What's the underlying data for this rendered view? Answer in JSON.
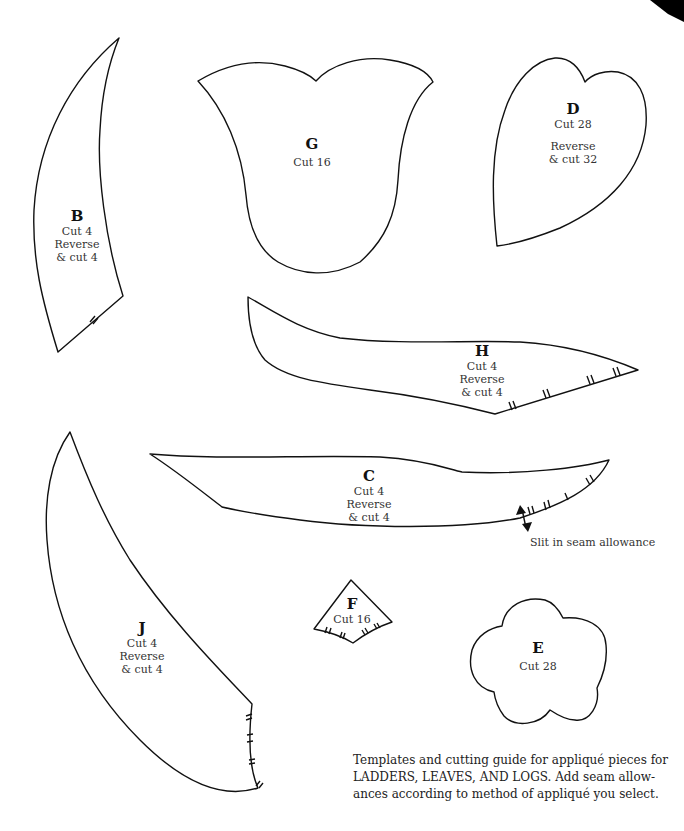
{
  "pieces": {
    "B": {
      "letter": "B",
      "lines": [
        "Cut 4",
        "Reverse",
        "& cut 4"
      ]
    },
    "G": {
      "letter": "G",
      "lines": [
        "Cut 16"
      ]
    },
    "D": {
      "letter": "D",
      "lines": [
        "Cut 28",
        "Reverse",
        "& cut 32"
      ]
    },
    "H": {
      "letter": "H",
      "lines": [
        "Cut 4",
        "Reverse",
        "& cut 4"
      ]
    },
    "C": {
      "letter": "C",
      "lines": [
        "Cut 4",
        "Reverse",
        "& cut 4"
      ]
    },
    "J": {
      "letter": "J",
      "lines": [
        "Cut 4",
        "Reverse",
        "& cut 4"
      ]
    },
    "F": {
      "letter": "F",
      "lines": [
        "Cut 16"
      ]
    },
    "E": {
      "letter": "E",
      "lines": [
        "Cut 28"
      ]
    }
  },
  "annotation": {
    "slit": "Slit in seam allowance"
  },
  "caption": {
    "lines": [
      "Templates and cutting guide for appliqué pieces for",
      "LADDERS, LEAVES, AND LOGS. Add seam allow-",
      "ances according to method of appliqué you select."
    ]
  },
  "colors": {
    "stroke": "#111111",
    "background": "#ffffff"
  }
}
